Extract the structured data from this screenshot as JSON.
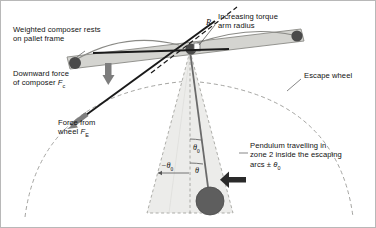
{
  "figure": {
    "background": "#ffffff",
    "border_color": "#b8b8b8",
    "width": 376,
    "height": 228
  },
  "annotations": {
    "composer": {
      "line1": "Weighted composer rests",
      "line2": "on pallet frame"
    },
    "torque": {
      "line1": "Increasing torque",
      "line2": "arm radius",
      "radius_symbol": "R"
    },
    "downward_force": {
      "line1": "Downward force",
      "line2_prefix": "of composer ",
      "symbol": "F",
      "subscript": "c"
    },
    "wheel_force": {
      "line1": "Force from",
      "line2_prefix": "wheel ",
      "symbol": "F",
      "subscript": "E"
    },
    "escape_wheel": {
      "label": "Escape wheel"
    },
    "pendulum_zone": {
      "line1": "Pendulum travelling in",
      "line2": "zone 2 inside the escaping",
      "line3_prefix": "arcs ± ",
      "symbol": "θ",
      "subscript": "0"
    }
  },
  "angles": {
    "negative_theta0": {
      "sign": "−",
      "symbol": "θ",
      "subscript": "0"
    },
    "theta0": {
      "symbol": "θ",
      "subscript": "0"
    },
    "theta": {
      "symbol": "θ"
    }
  },
  "colors": {
    "pallet_fill": "#d4d4d0",
    "pallet_stroke": "#8a8a86",
    "pivot_dark": "#4a4a4a",
    "bob_fill": "#5e5e5e",
    "zone_fill": "#ececea",
    "zone_stroke": "#9a9a96",
    "arc_stroke": "#9a9a96",
    "heavy_line": "#1a1a1a",
    "arrow_gray": "#7d7d7d",
    "text": "#111111"
  },
  "icons": {
    "down_arrow": "thick-down-arrow",
    "travel_arrow": "left-travel-arrow",
    "force_arrow": "diagonal-force-arrow"
  }
}
